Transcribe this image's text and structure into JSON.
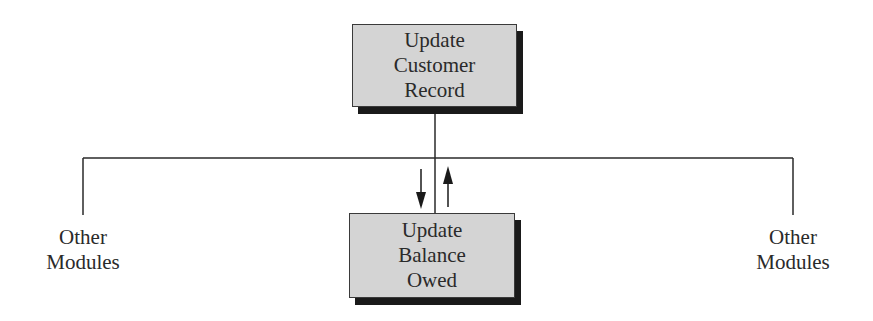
{
  "diagram": {
    "type": "structure-chart",
    "nodes": [
      {
        "id": "top",
        "lines": [
          "Update",
          "Customer",
          "Record"
        ]
      },
      {
        "id": "bottom",
        "lines": [
          "Update",
          "Balance",
          "Owed"
        ]
      }
    ],
    "side_labels": {
      "left": {
        "lines": [
          "Other",
          "Modules"
        ]
      },
      "right": {
        "lines": [
          "Other",
          "Modules"
        ]
      }
    },
    "colors": {
      "box_fill": "#d4d4d4",
      "box_shadow": "#1a1a1a",
      "line": "#2a2a2a"
    }
  }
}
